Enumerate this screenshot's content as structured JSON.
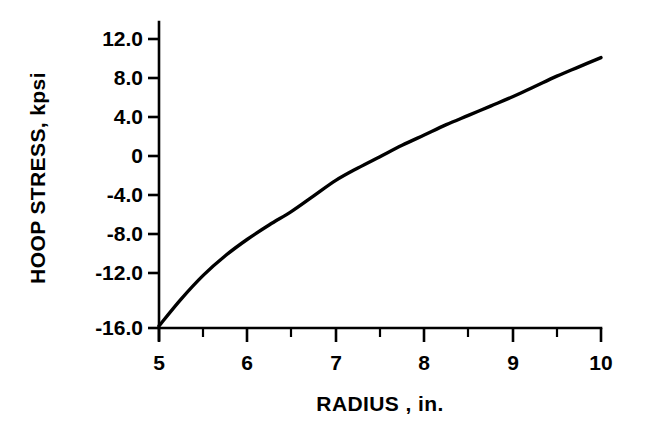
{
  "chart_data": {
    "type": "line",
    "title": "",
    "subtitle": "",
    "xlabel": "RADIUS , in.",
    "ylabel": "HOOP STRESS,  kpsi",
    "xlim": [
      5,
      10
    ],
    "ylim": [
      -16.0,
      12.0
    ],
    "grid": false,
    "legend": null,
    "x_ticks": [
      5,
      6,
      7,
      8,
      9,
      10
    ],
    "x_tick_labels": [
      "5",
      "6",
      "7",
      "8",
      "9",
      "10"
    ],
    "x_minor_ticks": [
      5.5,
      6.5,
      7.5,
      8.5,
      9.5
    ],
    "y_ticks": [
      12.0,
      8.0,
      4.0,
      0,
      -4.0,
      -8.0,
      -12.0,
      -16.0
    ],
    "y_tick_labels": [
      "12.0",
      "8.0",
      "4.0",
      "0",
      "-4.0",
      "-8.0",
      "-12.0",
      "-16.0"
    ],
    "series": [
      {
        "name": "hoop stress",
        "color": "#000000",
        "x": [
          5.0,
          5.25,
          5.5,
          5.75,
          6.0,
          6.25,
          6.5,
          6.75,
          7.0,
          7.25,
          7.5,
          7.75,
          8.0,
          8.25,
          8.5,
          8.75,
          9.0,
          9.25,
          9.5,
          9.75,
          10.0
        ],
        "values": [
          -15.8,
          -13.2,
          -10.9,
          -9.0,
          -7.4,
          -6.0,
          -4.7,
          -3.2,
          -1.7,
          -0.5,
          0.6,
          1.7,
          2.7,
          3.7,
          4.6,
          5.5,
          6.4,
          7.4,
          8.4,
          9.3,
          10.2
        ]
      }
    ]
  },
  "axes": {
    "y_axis_title": "HOOP STRESS,  kpsi",
    "x_axis_title": "RADIUS , in."
  }
}
